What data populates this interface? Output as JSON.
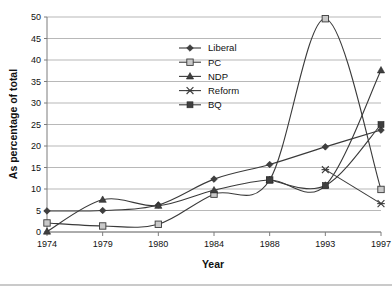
{
  "chart_data": {
    "type": "line",
    "title": "",
    "xlabel": "Year",
    "ylabel": "As percentage of total",
    "categories": [
      "1974",
      "1979",
      "1980",
      "1984",
      "1988",
      "1993",
      "1997"
    ],
    "x": [
      1974,
      1979,
      1980,
      1984,
      1988,
      1993,
      1997
    ],
    "ylim": [
      0,
      50
    ],
    "yticks": [
      0,
      5,
      10,
      15,
      20,
      25,
      30,
      35,
      40,
      45,
      50
    ],
    "ytick_labels": [
      "0",
      "5",
      "10",
      "15",
      "20",
      "25",
      "30",
      "35",
      "40",
      "45",
      "50"
    ],
    "grid": true,
    "legend_position": "upper center-left",
    "interpolation": "smooth",
    "series": [
      {
        "name": "Liberal",
        "marker": "diamond",
        "values": [
          4.9,
          5.0,
          6.3,
          12.3,
          15.7,
          19.8,
          23.7
        ]
      },
      {
        "name": "PC",
        "marker": "open-square",
        "values": [
          2.1,
          1.4,
          1.8,
          8.8,
          12.1,
          49.6,
          9.9
        ]
      },
      {
        "name": "NDP",
        "marker": "triangle",
        "values": [
          0.1,
          7.5,
          6.1,
          9.7,
          12.1,
          10.8,
          37.6
        ]
      },
      {
        "name": "Reform",
        "marker": "cross",
        "values": [
          null,
          null,
          null,
          null,
          null,
          14.5,
          6.6
        ]
      },
      {
        "name": "BQ",
        "marker": "filled-square",
        "values": [
          null,
          null,
          null,
          null,
          12.1,
          10.8,
          25.0
        ]
      }
    ]
  },
  "legend": {
    "items": [
      {
        "label": "Liberal"
      },
      {
        "label": "PC"
      },
      {
        "label": "NDP"
      },
      {
        "label": "Reform"
      },
      {
        "label": "BQ"
      }
    ]
  },
  "colors": {
    "line": "#3a3a3a",
    "grid": "#9a9a9a",
    "axis": "#7d7d7d",
    "text": "#111111",
    "background": "#ffffff"
  }
}
